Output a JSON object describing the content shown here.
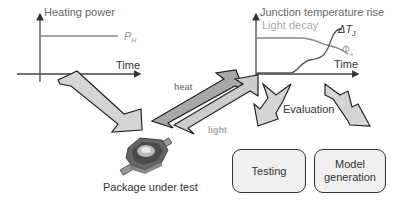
{
  "left_chart": {
    "y_label": "Heating power",
    "x_label": "Time",
    "series_label": "P",
    "series_subscript": "H"
  },
  "right_chart": {
    "y_label": "Junction temperature rise",
    "light_label": "Light decay",
    "x_label": "Time",
    "delta_label": "ΔT",
    "delta_subscript": "J",
    "phi_label": "Φ",
    "phi_subscript": "e"
  },
  "arrows": {
    "heat_label": "heat",
    "light_label": "light"
  },
  "package_label": "Package under test",
  "evaluation_label": "Evaluation",
  "boxes": {
    "testing": "Testing",
    "model_line1": "Model",
    "model_line2": "generation"
  },
  "colors": {
    "axis": "#333333",
    "arrow_fill_light": "#d4d4d4",
    "arrow_fill_mid": "#b8b8b8",
    "arrow_fill_dark": "#999999",
    "text_dark": "#333333",
    "text_gray": "#999999",
    "box_fill": "#f0f0f0"
  }
}
